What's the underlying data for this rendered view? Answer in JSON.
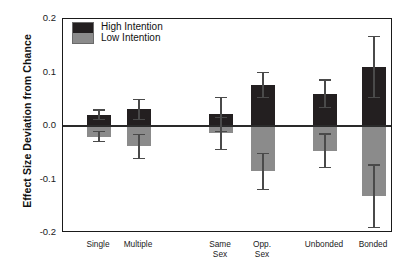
{
  "chart_data": {
    "type": "bar",
    "title": "",
    "subtitle": "",
    "xlabel": "",
    "ylabel": "Effect Size Deviation from Chance",
    "ylim": [
      -0.2,
      0.2
    ],
    "yticks": [
      "0.2",
      "0.1",
      "0.0",
      "-0.1",
      "-0.2"
    ],
    "ytick_values": [
      0.2,
      0.1,
      0.0,
      -0.1,
      -0.2
    ],
    "grid": false,
    "legend_position": "top-left",
    "zero_reference_line": true,
    "orientation": "vertical",
    "bar_style": "diverging-from-zero",
    "categories": [
      "Single",
      "Multiple",
      "Same\nSex",
      "Opp.\nSex",
      "Unbonded",
      "Bonded"
    ],
    "category_labels_flat": [
      "Single",
      "Multiple",
      "Same Sex",
      "Opp. Sex",
      "Unbonded",
      "Bonded"
    ],
    "series": [
      {
        "name": "High Intention",
        "color": "#231f20",
        "values": [
          0.021,
          0.031,
          0.022,
          0.077,
          0.06,
          0.111
        ],
        "errors": [
          0.009,
          0.019,
          0.032,
          0.023,
          0.026,
          0.057
        ]
      },
      {
        "name": "Low Intention",
        "color": "#8b8b8b",
        "values": [
          -0.02,
          -0.038,
          -0.014,
          -0.085,
          -0.046,
          -0.131
        ],
        "errors": [
          0.009,
          0.022,
          0.03,
          0.033,
          0.031,
          0.058
        ]
      }
    ]
  },
  "legend": {
    "entries": [
      {
        "label": "High Intention",
        "color": "#231f20"
      },
      {
        "label": "Low Intention",
        "color": "#8b8b8b"
      }
    ]
  },
  "axes": {
    "y_title": "Effect Size Deviation from Chance",
    "y_tick_labels": [
      "0.2",
      "0.1",
      "0.0",
      "-0.1",
      "-0.2"
    ],
    "x_tick_labels": [
      "Single",
      "Multiple",
      "Same\nSex",
      "Opp.\nSex",
      "Unbonded",
      "Bonded"
    ]
  },
  "colors": {
    "high_intention": "#231f20",
    "low_intention": "#8b8b8b",
    "axis": "#1a1a1a",
    "error_bar": "#4a4a4a",
    "background": "#ffffff"
  }
}
